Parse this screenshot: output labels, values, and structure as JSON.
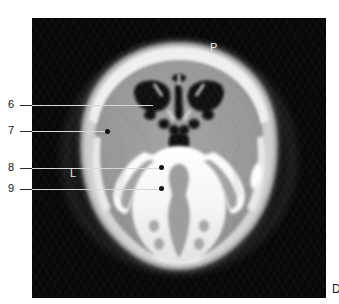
{
  "figure": {
    "type": "axial-head-tomogram",
    "modality_appearance": "grayscale-ct-axial-slice",
    "background_color": "#050505",
    "margin_color": "#ffffff"
  },
  "orientation_markers": [
    {
      "key": "posterior",
      "label": "P",
      "position": "top-center"
    },
    {
      "key": "anterior",
      "label": "A",
      "position": "bottom-center"
    },
    {
      "key": "left",
      "label": "L",
      "position": "left-middle"
    },
    {
      "key": "right",
      "label": "R",
      "position": "right-middle"
    }
  ],
  "callouts": [
    {
      "id": "callout-6",
      "label": "6",
      "has_end_dot": false,
      "target": "paranasal-sinus-air-cells"
    },
    {
      "id": "callout-7",
      "label": "7",
      "has_end_dot": true,
      "target": "temporal-lobe-soft-tissue"
    },
    {
      "id": "callout-8",
      "label": "8",
      "has_end_dot": true,
      "target": "petrous-temporal-bone"
    },
    {
      "id": "callout-9",
      "label": "9",
      "has_end_dot": true,
      "target": "basiocciput-clivus-region"
    }
  ],
  "corner": {
    "glyph": "D"
  },
  "colors": {
    "bone_bright": "#fcfcfc",
    "soft_tissue_mid": "#9a9a9a",
    "soft_tissue_light": "#c9c9c9",
    "air_dark": "#0a0a0a",
    "label_text": "#111111",
    "marker_text": "#e8e8e8",
    "leader_line": "#2b2b2b"
  }
}
